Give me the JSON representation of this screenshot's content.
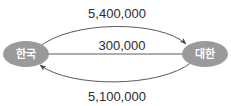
{
  "diagram": {
    "type": "directed-graph",
    "background_color": "#ffffff",
    "node_fill_color": "#9a9a9a",
    "node_text_color": "#ffffff",
    "edge_color": "#5a5a5a",
    "label_text_color": "#2b2b2b",
    "nodes": [
      {
        "id": "left",
        "label": "한국"
      },
      {
        "id": "right",
        "label": "대한"
      }
    ],
    "edges": [
      {
        "id": "top",
        "label": "5,400,000",
        "from": "한국",
        "to": "대한",
        "direction": "right",
        "shape": "arc-up"
      },
      {
        "id": "middle",
        "label": "300,000",
        "from": "대한",
        "to": "한국",
        "direction": "left",
        "shape": "straight"
      },
      {
        "id": "bottom",
        "label": "5,100,000",
        "from": "대한",
        "to": "한국",
        "direction": "left",
        "shape": "arc-down"
      }
    ]
  }
}
